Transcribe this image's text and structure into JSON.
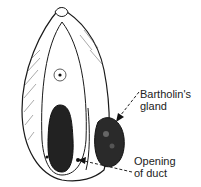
{
  "figure": {
    "colors": {
      "ink": "#1a1a1a",
      "background": "#ffffff",
      "dark_fill": "#222222"
    }
  },
  "labels": [
    {
      "id": "gland",
      "lines": [
        "Bartholin's",
        "gland"
      ]
    },
    {
      "id": "duct",
      "lines": [
        "Opening",
        "of duct"
      ]
    }
  ]
}
